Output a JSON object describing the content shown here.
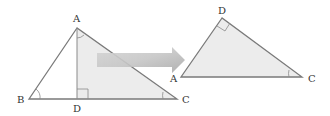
{
  "diagram": {
    "colors": {
      "line": "#7a7a7a",
      "fill": "#ececec",
      "arrow_light": "#e6e6e6",
      "arrow_dark": "#b4b4b4",
      "label": "#333333"
    },
    "left_triangle": {
      "labels": {
        "A": "A",
        "B": "B",
        "C": "C",
        "D": "D"
      }
    },
    "right_triangle": {
      "labels": {
        "D": "D",
        "A": "A",
        "C": "C"
      }
    }
  }
}
